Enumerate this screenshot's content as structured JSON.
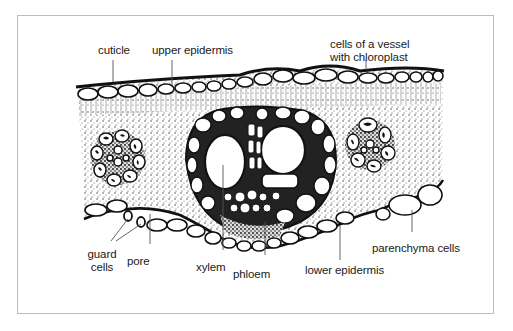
{
  "diagram": {
    "labels": {
      "cuticle": "cuticle",
      "upper_epidermis": "upper epidermis",
      "vessel_line1": "cells of a vessel",
      "vessel_line2": "with chloroplast",
      "guard_line1": "guard",
      "guard_line2": "cells",
      "pore": "pore",
      "xylem": "xylem",
      "phloem": "phloem",
      "lower_epidermis": "lower epidermis",
      "parenchyma": "parenchyma cells"
    },
    "colors": {
      "ink": "#111111",
      "frame": "#bdbdbd",
      "background": "#ffffff"
    }
  }
}
